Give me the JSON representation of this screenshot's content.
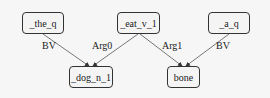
{
  "diagram": {
    "type": "semantic-dependency-graph",
    "nodes": [
      {
        "id": "the",
        "label": "_the_q"
      },
      {
        "id": "eat",
        "label": "_eat_v_1"
      },
      {
        "id": "a",
        "label": "_a_q"
      },
      {
        "id": "dog",
        "label": "_dog_n_1"
      },
      {
        "id": "bone",
        "label": "bone"
      }
    ],
    "edges": [
      {
        "from": "the",
        "to": "dog",
        "label": "BV"
      },
      {
        "from": "eat",
        "to": "dog",
        "label": "Arg0"
      },
      {
        "from": "eat",
        "to": "bone",
        "label": "Arg1"
      },
      {
        "from": "a",
        "to": "bone",
        "label": "BV"
      }
    ]
  }
}
